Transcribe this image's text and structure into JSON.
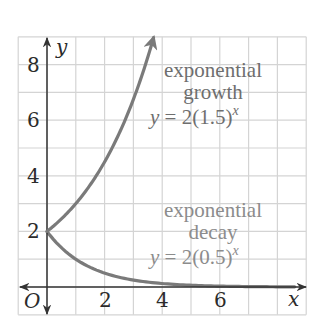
{
  "chart_data": {
    "type": "line",
    "title": "",
    "xlabel": "x",
    "ylabel": "y",
    "origin_label": "O",
    "xlim": [
      -1,
      9
    ],
    "ylim": [
      -1,
      9
    ],
    "grid": true,
    "x_ticks": [
      2,
      4,
      6
    ],
    "y_ticks": [
      2,
      4,
      6,
      8
    ],
    "series": [
      {
        "name": "exponential growth",
        "equation": "y = 2(1.5)^x",
        "base": 1.5,
        "initial": 2,
        "x_range": [
          0,
          3.7
        ],
        "x": [
          0,
          0.5,
          1,
          1.5,
          2,
          2.5,
          3,
          3.5
        ],
        "values": [
          2,
          2.45,
          3,
          3.67,
          4.5,
          5.51,
          6.75,
          8.27
        ],
        "color": "#7a7a7a",
        "arrow_end": true
      },
      {
        "name": "exponential decay",
        "equation": "y = 2(0.5)^x",
        "base": 0.5,
        "initial": 2,
        "x_range": [
          0,
          9
        ],
        "x": [
          0,
          1,
          2,
          3,
          4,
          5,
          6,
          7,
          8
        ],
        "values": [
          2,
          1,
          0.5,
          0.25,
          0.125,
          0.0625,
          0.03125,
          0.0156,
          0.0078
        ],
        "color": "#7a7a7a",
        "arrow_end": true
      }
    ],
    "annotations": [
      {
        "lines": [
          "exponential",
          "growth"
        ],
        "equation_prefix": "y = 2(1.5)",
        "exponent": "x"
      },
      {
        "lines": [
          "exponential",
          "decay"
        ],
        "equation_prefix": "y = 2(0.5)",
        "exponent": "x"
      }
    ]
  },
  "labels": {
    "x_axis": "x",
    "y_axis": "y",
    "origin": "O",
    "x_tick_2": "2",
    "x_tick_4": "4",
    "x_tick_6": "6",
    "y_tick_2": "2",
    "y_tick_4": "4",
    "y_tick_6": "6",
    "y_tick_8": "8",
    "growth_line1": "exponential",
    "growth_line2": "growth",
    "growth_eq_lhs": "y",
    "growth_eq_rhs": " = 2(1.5)",
    "growth_eq_exp": "x",
    "decay_line1": "exponential",
    "decay_line2": "decay",
    "decay_eq_lhs": "y",
    "decay_eq_rhs": " = 2(0.5)",
    "decay_eq_exp": "x"
  },
  "colors": {
    "grid": "#d4d4d4",
    "axis": "#333333",
    "curve": "#7a7a7a",
    "growth_text": "#6e6e6e",
    "decay_text": "#8c8c8c"
  }
}
